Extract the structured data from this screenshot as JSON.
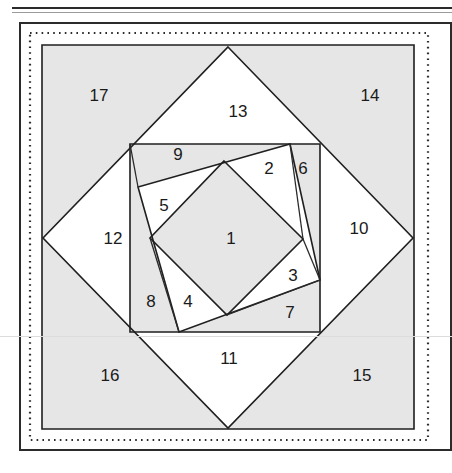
{
  "figure": {
    "colors": {
      "shaded_fill": "#e6e6e6",
      "white_fill": "#ffffff",
      "line": "#1f1f1f",
      "frame": "#2b2b2b"
    },
    "region_labels": [
      {
        "id": "1",
        "text": "1",
        "x": 231,
        "y": 240
      },
      {
        "id": "2",
        "text": "2",
        "x": 269,
        "y": 170
      },
      {
        "id": "3",
        "text": "3",
        "x": 293,
        "y": 277
      },
      {
        "id": "4",
        "text": "4",
        "x": 188,
        "y": 303
      },
      {
        "id": "5",
        "text": "5",
        "x": 164,
        "y": 207
      },
      {
        "id": "6",
        "text": "6",
        "x": 303,
        "y": 170
      },
      {
        "id": "7",
        "text": "7",
        "x": 290,
        "y": 314
      },
      {
        "id": "8",
        "text": "8",
        "x": 151,
        "y": 303
      },
      {
        "id": "9",
        "text": "9",
        "x": 178,
        "y": 156
      },
      {
        "id": "10",
        "text": "10",
        "x": 359,
        "y": 230
      },
      {
        "id": "11",
        "text": "11",
        "x": 229,
        "y": 360
      },
      {
        "id": "12",
        "text": "12",
        "x": 113,
        "y": 240
      },
      {
        "id": "13",
        "text": "13",
        "x": 238,
        "y": 113
      },
      {
        "id": "14",
        "text": "14",
        "x": 370,
        "y": 97
      },
      {
        "id": "15",
        "text": "15",
        "x": 362,
        "y": 377
      },
      {
        "id": "16",
        "text": "16",
        "x": 110,
        "y": 377
      },
      {
        "id": "17",
        "text": "17",
        "x": 99,
        "y": 97
      }
    ],
    "frames": {
      "outer_rect": {
        "x": 19,
        "y": 22,
        "w": 433,
        "h": 429
      },
      "dotted_rect": {
        "x": 29,
        "y": 32,
        "w": 400,
        "h": 409
      },
      "shaded_rect": {
        "x": 42,
        "y": 45,
        "w": 372,
        "h": 384
      }
    },
    "shapes": {
      "outer_square": [
        [
          42,
          45
        ],
        [
          414,
          45
        ],
        [
          414,
          429
        ],
        [
          42,
          429
        ]
      ],
      "diamond": [
        [
          228,
          47
        ],
        [
          413,
          238
        ],
        [
          228,
          428
        ],
        [
          43,
          238
        ]
      ],
      "middle_square": [
        [
          130,
          144
        ],
        [
          320,
          144
        ],
        [
          320,
          332
        ],
        [
          130,
          332
        ]
      ],
      "tilted_square": [
        [
          290,
          144
        ],
        [
          320,
          280
        ],
        [
          179,
          332
        ],
        [
          138,
          187
        ]
      ],
      "inner_square": [
        [
          224,
          161
        ],
        [
          303,
          239
        ],
        [
          227,
          315
        ],
        [
          150,
          238
        ]
      ]
    },
    "counts": {
      "regions": 17,
      "squares": 5
    }
  }
}
